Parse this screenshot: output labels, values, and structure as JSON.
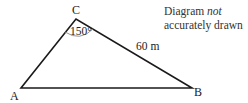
{
  "diagram": {
    "type": "triangle",
    "vertices": [
      {
        "name": "A",
        "x": 21,
        "y": 88
      },
      {
        "name": "B",
        "x": 192,
        "y": 88
      },
      {
        "name": "C",
        "x": 76,
        "y": 19
      }
    ],
    "angle_label": "150°",
    "side_label": "60 m",
    "note_line1_plain": "Diagram ",
    "note_line1_italic": "not",
    "note_line2": "accurately drawn",
    "line_color": "#1a1a1a",
    "arc_color": "#888888"
  }
}
